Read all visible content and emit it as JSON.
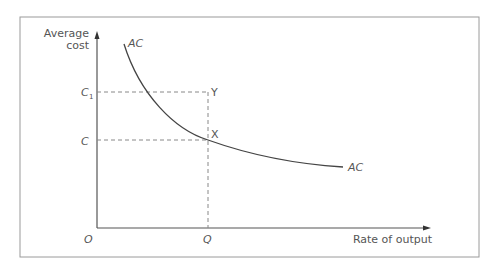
{
  "diagram": {
    "y_axis_label_line1": "Average",
    "y_axis_label_line2": "cost",
    "x_axis_label": "Rate of output",
    "origin_label": "O",
    "curve_label_top": "AC",
    "curve_label_end": "AC",
    "c1_label": "C",
    "c1_subscript": "1",
    "c_label": "C",
    "q_label": "Q",
    "point_y_label": "Y",
    "point_x_label": "X"
  },
  "colors": {
    "line": "#4a4a4a",
    "dash": "#888888",
    "frame": "#999999",
    "text": "#555555"
  }
}
